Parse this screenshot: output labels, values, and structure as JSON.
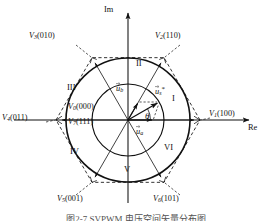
{
  "figure": {
    "caption": "图2-7  SVPWM 电压空间矢量分布图",
    "background": "#ffffff",
    "line_color": "#111111"
  },
  "axes": {
    "real_label": "Re",
    "imag_label": "Im",
    "origin": {
      "x": 128,
      "y": 120
    }
  },
  "geometry": {
    "outer_circle_radius": 62,
    "inner_circle_radius": 36,
    "hexagon_radius": 72,
    "sector_angles_deg": [
      0,
      60,
      120,
      180,
      240,
      300
    ]
  },
  "vectors": {
    "active": [
      {
        "name": "V1",
        "label": "V",
        "subscript": "1",
        "switching_state": "(100)",
        "angle_deg": 0
      },
      {
        "name": "V2",
        "label": "V",
        "subscript": "2",
        "switching_state": "(110)",
        "angle_deg": 60
      },
      {
        "name": "V3",
        "label": "V",
        "subscript": "3",
        "switching_state": "(010)",
        "angle_deg": 120
      },
      {
        "name": "V4",
        "label": "V",
        "subscript": "4",
        "switching_state": "(011)",
        "angle_deg": 180
      },
      {
        "name": "V5",
        "label": "V",
        "subscript": "5",
        "switching_state": "(001)",
        "angle_deg": 240
      },
      {
        "name": "V6",
        "label": "V",
        "subscript": "6",
        "switching_state": "(101)",
        "angle_deg": 300
      }
    ],
    "zero": [
      {
        "name": "V0",
        "label": "V",
        "subscript": "0",
        "switching_state": "(000)"
      },
      {
        "name": "V7",
        "label": "V",
        "subscript": "7",
        "switching_state": "(111)"
      }
    ],
    "reference": {
      "name": "us_ref",
      "label": "u",
      "subscript": "s",
      "superscript": "*",
      "angle_deg": 30,
      "magnitude": 36
    },
    "components": [
      {
        "name": "ua",
        "label": "u",
        "subscript": "a",
        "angle_deg": 0,
        "magnitude": 31
      },
      {
        "name": "ub",
        "label": "u",
        "subscript": "b",
        "angle_deg": 60,
        "magnitude": 18
      }
    ],
    "angle_marker": {
      "name": "theta",
      "label": "θ",
      "value_deg": 30
    }
  },
  "sectors": [
    {
      "id": "I",
      "label": "I",
      "center_angle_deg": 30
    },
    {
      "id": "II",
      "label": "II",
      "center_angle_deg": 90
    },
    {
      "id": "III",
      "label": "III",
      "center_angle_deg": 150
    },
    {
      "id": "IV",
      "label": "IV",
      "center_angle_deg": 210
    },
    {
      "id": "V",
      "label": "V",
      "center_angle_deg": 270
    },
    {
      "id": "VI",
      "label": "VI",
      "center_angle_deg": 330
    }
  ]
}
